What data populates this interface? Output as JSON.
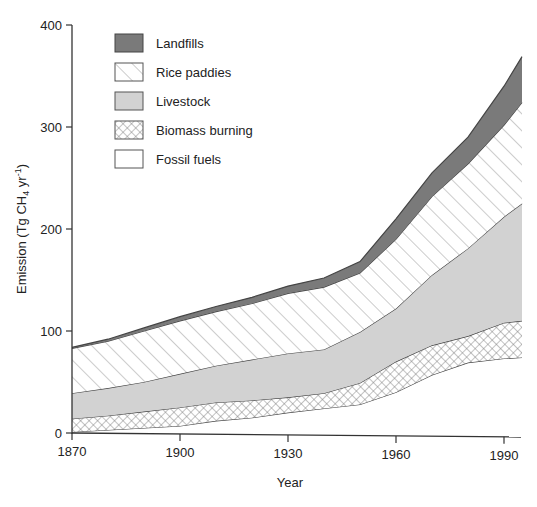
{
  "chart_data": {
    "type": "area",
    "stacked": true,
    "title": "",
    "xlabel": "Year",
    "ylabel": "Emission (Tg CH4 yr-1)",
    "ylabel_parts": {
      "main": "Emission (Tg CH",
      "sub": "4",
      "mid": " yr",
      "sup": "-1",
      "end": ")"
    },
    "xlim": [
      1870,
      1995
    ],
    "ylim": [
      0,
      400
    ],
    "x_ticks": [
      1870,
      1900,
      1930,
      1960,
      1990
    ],
    "y_ticks": [
      0,
      100,
      200,
      300,
      400
    ],
    "grid": false,
    "legend_position": "upper-left",
    "legend": [
      "Landfills",
      "Rice paddies",
      "Livestock",
      "Biomass burning",
      "Fossil fuels"
    ],
    "x": [
      1870,
      1880,
      1890,
      1900,
      1910,
      1920,
      1930,
      1940,
      1950,
      1960,
      1970,
      1980,
      1990,
      1995
    ],
    "series": [
      {
        "name": "Fossil fuels",
        "pattern": "white",
        "values": [
          1,
          3,
          5,
          7,
          12,
          15,
          20,
          24,
          28,
          40,
          57,
          69,
          73,
          74
        ]
      },
      {
        "name": "Biomass burning",
        "pattern": "crosshatch",
        "values": [
          13,
          14,
          16,
          18,
          18,
          17,
          15,
          15,
          21,
          30,
          29,
          26,
          35,
          36
        ]
      },
      {
        "name": "Livestock",
        "pattern": "light-gray",
        "values": [
          25,
          27,
          29,
          33,
          36,
          40,
          43,
          43,
          50,
          52,
          69,
          86,
          104,
          115
        ]
      },
      {
        "name": "Rice paddies",
        "pattern": "diagonal-hatch",
        "values": [
          44,
          46,
          50,
          52,
          53,
          55,
          59,
          61,
          58,
          68,
          77,
          83,
          90,
          99
        ]
      },
      {
        "name": "Landfills",
        "pattern": "dark-gray",
        "values": [
          1,
          2,
          3,
          4,
          5,
          6,
          7,
          9,
          11,
          20,
          23,
          26,
          38,
          45
        ]
      }
    ],
    "cumulative_totals": [
      84,
      92,
      103,
      114,
      124,
      133,
      144,
      152,
      168,
      210,
      255,
      290,
      340,
      369
    ]
  },
  "legend": {
    "items": [
      {
        "label": "Landfills",
        "fill": "dark"
      },
      {
        "label": "Rice paddies",
        "fill": "hatch"
      },
      {
        "label": "Livestock",
        "fill": "light"
      },
      {
        "label": "Biomass burning",
        "fill": "cross"
      },
      {
        "label": "Fossil fuels",
        "fill": "white"
      }
    ]
  },
  "axes": {
    "x_title": "Year",
    "x_tick_labels": [
      "1870",
      "1900",
      "1930",
      "1960",
      "1990"
    ],
    "y_tick_labels": [
      "0",
      "100",
      "200",
      "300",
      "400"
    ]
  },
  "colors": {
    "landfills": "#7a7a7a",
    "livestock": "#d2d2d2",
    "outline": "#444444",
    "hatch": "#9a9a9a"
  }
}
